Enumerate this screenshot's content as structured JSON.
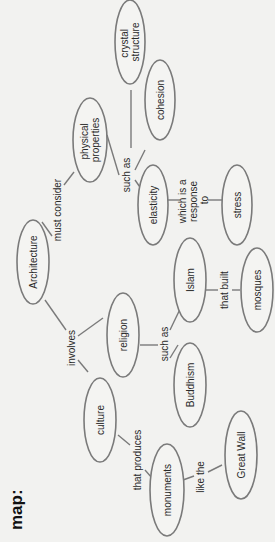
{
  "title": "map:",
  "nodes": {
    "crystal_structure": [
      "crystal",
      "structure"
    ],
    "cohesion": "cohesion",
    "physical_properties": [
      "physical",
      "properties"
    ],
    "elasticity": "elasticity",
    "stress": "stress",
    "architecture": "Architecture",
    "islam": "Islam",
    "mosques": "mosques",
    "religion": "religion",
    "buddhism": "Buddhism",
    "culture": "culture",
    "monuments": "monuments",
    "great_wall": "Great Wall"
  },
  "links": {
    "must_consider": "must consider",
    "such_as_1": "such as",
    "which_is_a_response_to": [
      "which is a",
      "response",
      "to"
    ],
    "involves": "involves",
    "such_as_2": "such as",
    "that_built": "that built",
    "that_produces": "that produces",
    "like_the": "like the"
  }
}
